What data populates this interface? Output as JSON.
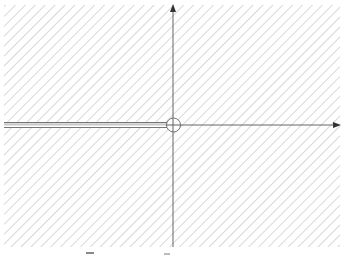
{
  "diagram": {
    "type": "complex-plane-keyhole-contour",
    "colors": {
      "background": "#ffffff",
      "hatch": "#b8b8b8",
      "axis": "#555555",
      "contour": "#666666",
      "branch_cut_fill": "#c8c8c8"
    },
    "region": {
      "x": 4,
      "y": 5,
      "width": 336,
      "height": 242
    },
    "hatch_spacing": 7,
    "origin": {
      "x": 173,
      "y": 125
    },
    "real_axis": {
      "x_start": 4,
      "x_end": 340,
      "arrow": "right"
    },
    "imaginary_axis": {
      "y_start": 247,
      "y_end": 5,
      "arrow": "up"
    },
    "origin_circle_radius": 7,
    "branch_cut": {
      "x_start": 4,
      "x_end": 167,
      "upper_y": 122.5,
      "lower_y": 127.5
    }
  }
}
